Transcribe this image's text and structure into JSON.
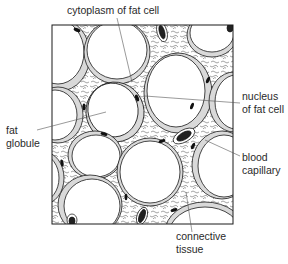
{
  "diagram": {
    "labels": {
      "cytoplasm": "cytoplasm of fat cell",
      "nucleus_line1": "nucleus",
      "nucleus_line2": "of fat cell",
      "fat_line1": "fat",
      "fat_line2": "globule",
      "blood_line1": "blood",
      "blood_line2": "capillary",
      "connective_line1": "connective",
      "connective_line2": "tissue"
    },
    "colors": {
      "line": "#1a1a1a",
      "leader": "#555555",
      "cytoplasm_fill": "#d9d9d9",
      "nucleus_fill": "#111111",
      "background": "#ffffff"
    }
  }
}
